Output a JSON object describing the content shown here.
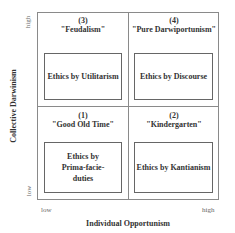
{
  "axes": {
    "x_label": "Individual Opportunism",
    "y_label": "Collective Darwinism",
    "x_low": "low",
    "x_high": "high",
    "y_low": "low",
    "y_high": "high"
  },
  "quadrants": [
    {
      "number": "(3)",
      "name": "\"Feudalism\"",
      "ethics": "Ethics by Utilitarism",
      "position": "top-left"
    },
    {
      "number": "(4)",
      "name": "\"Pure Darwiportunism\"",
      "ethics": "Ethics by Discourse",
      "position": "top-right"
    },
    {
      "number": "(1)",
      "name": "\"Good Old Time\"",
      "ethics": "Ethics by Prima-facie-duties",
      "position": "bottom-left"
    },
    {
      "number": "(2)",
      "name": "\"Kindergarten\"",
      "ethics": "Ethics by Kantianism",
      "position": "bottom-right"
    }
  ]
}
